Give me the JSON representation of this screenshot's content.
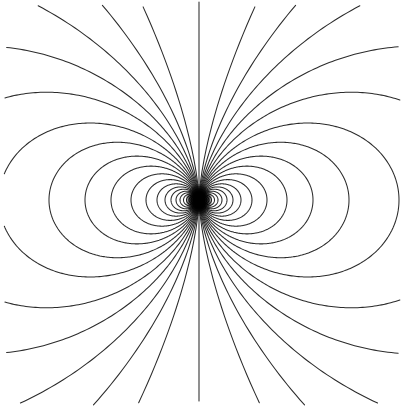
{
  "figure": {
    "kind": "magnetic-dipole-field-diagram",
    "width": 404,
    "height": 409,
    "background_color": "#ffffff",
    "line_color": "#2b2b2b",
    "core_color": "#000000",
    "line_width": 1.05
  },
  "chart_data": {
    "type": "line",
    "subtitle": "",
    "xlabel": "",
    "ylabel": "",
    "grid": false,
    "legend": null,
    "axes_visible": false,
    "tick_labels": [],
    "annotations": [],
    "xlim": [
      0,
      404
    ],
    "ylim": [
      0,
      409
    ],
    "dipole": {
      "center_x": 199,
      "center_y": 200,
      "axis_orientation": "vertical",
      "core_radius_x": 13,
      "core_radius_y": 16,
      "core_label": "dipole-core"
    },
    "model": {
      "equation": "r = r0 * sin(theta)^2",
      "description": "Field lines of an ideal point magnetic dipole. Each line is parameterised by its equatorial radius r0; the polar axis is vertical so the loops bulge to the left and right of centre.",
      "theta_samples": 420,
      "theta_min_deg": 0.35,
      "theta_max_deg": 179.65
    },
    "series": [
      {
        "name": "loop-01",
        "r0": 6,
        "closed": true,
        "side": "both"
      },
      {
        "name": "loop-02",
        "r0": 8,
        "closed": true,
        "side": "both"
      },
      {
        "name": "loop-03",
        "r0": 10,
        "closed": true,
        "side": "both"
      },
      {
        "name": "loop-04",
        "r0": 12.5,
        "closed": true,
        "side": "both"
      },
      {
        "name": "loop-05",
        "r0": 15.5,
        "closed": true,
        "side": "both"
      },
      {
        "name": "loop-06",
        "r0": 19,
        "closed": true,
        "side": "both"
      },
      {
        "name": "loop-07",
        "r0": 23,
        "closed": true,
        "side": "both"
      },
      {
        "name": "loop-08",
        "r0": 28,
        "closed": true,
        "side": "both"
      },
      {
        "name": "loop-09",
        "r0": 34,
        "closed": true,
        "side": "both"
      },
      {
        "name": "loop-10",
        "r0": 42,
        "closed": true,
        "side": "both"
      },
      {
        "name": "loop-11",
        "r0": 53,
        "closed": true,
        "side": "both"
      },
      {
        "name": "loop-12",
        "r0": 68,
        "closed": true,
        "side": "both"
      },
      {
        "name": "loop-13",
        "r0": 88,
        "closed": true,
        "side": "both"
      },
      {
        "name": "loop-14",
        "r0": 114,
        "closed": true,
        "side": "both"
      },
      {
        "name": "loop-15",
        "r0": 150,
        "closed": false,
        "side": "both"
      },
      {
        "name": "loop-16",
        "r0": 200,
        "closed": false,
        "side": "both"
      },
      {
        "name": "loop-17",
        "r0": 280,
        "closed": false,
        "side": "both"
      },
      {
        "name": "loop-18",
        "r0": 400,
        "closed": false,
        "side": "both"
      },
      {
        "name": "loop-19",
        "r0": 620,
        "closed": false,
        "side": "both"
      },
      {
        "name": "loop-20",
        "r0": 1100,
        "closed": false,
        "side": "both"
      },
      {
        "name": "loop-21",
        "r0": 2600,
        "closed": false,
        "side": "both"
      }
    ],
    "polar_axis_line": {
      "name": "polar-axis-field-line",
      "x": 199,
      "y_top": 2,
      "y_bottom": 401
    },
    "edge_crossings": {
      "top_edge_x": [
        138,
        199,
        258
      ],
      "bottom_edge_x": [
        138,
        199,
        258
      ],
      "left_curve_endpoints": [
        [
          13,
          135
        ],
        [
          16,
          385
        ]
      ],
      "right_curve_endpoints": [
        [
          391,
          135
        ],
        [
          388,
          385
        ]
      ]
    }
  }
}
